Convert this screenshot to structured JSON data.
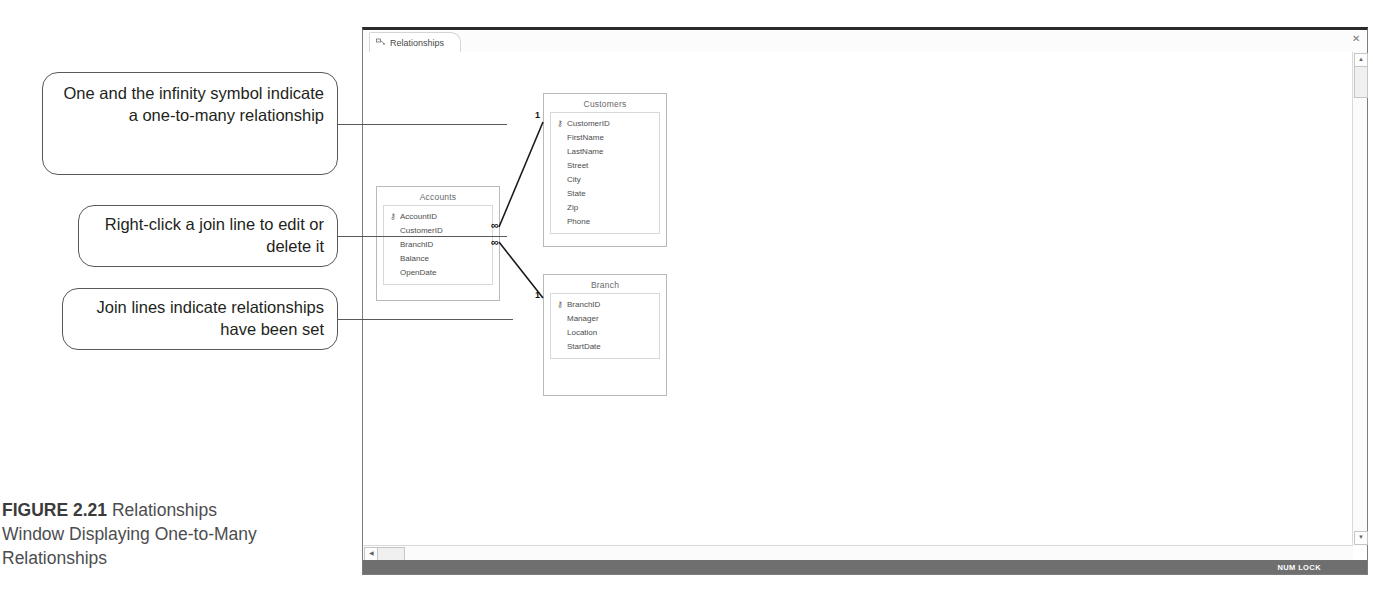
{
  "caption": {
    "figure_label": "FIGURE 2.21",
    "text": " Relationships Window Displaying One-to-Many Relationships"
  },
  "callouts": [
    {
      "id": "callout-1",
      "text": "One and the infinity symbol indicate a one-to-many relationship"
    },
    {
      "id": "callout-2",
      "text": "Right-click a join line to edit or delete it"
    },
    {
      "id": "callout-3",
      "text": "Join lines indicate relationships have been set"
    }
  ],
  "window": {
    "tab": {
      "label": "Relationships",
      "icon": "relationships-icon"
    },
    "close_label": "✕",
    "status_bar": {
      "num_lock": "NUM LOCK"
    },
    "scrollbar": {
      "up_arrow": "▲",
      "down_arrow": "▼",
      "left_arrow": "◀"
    }
  },
  "tables": [
    {
      "id": "tbl-customers",
      "name": "Customers",
      "fields": [
        {
          "name": "CustomerID",
          "key": true
        },
        {
          "name": "FirstName",
          "key": false
        },
        {
          "name": "LastName",
          "key": false
        },
        {
          "name": "Street",
          "key": false
        },
        {
          "name": "City",
          "key": false
        },
        {
          "name": "State",
          "key": false
        },
        {
          "name": "Zip",
          "key": false
        },
        {
          "name": "Phone",
          "key": false
        }
      ]
    },
    {
      "id": "tbl-accounts",
      "name": "Accounts",
      "fields": [
        {
          "name": "AccountID",
          "key": true
        },
        {
          "name": "CustomerID",
          "key": false
        },
        {
          "name": "BranchID",
          "key": false
        },
        {
          "name": "Balance",
          "key": false
        },
        {
          "name": "OpenDate",
          "key": false
        }
      ]
    },
    {
      "id": "tbl-branch",
      "name": "Branch",
      "fields": [
        {
          "name": "BranchID",
          "key": true
        },
        {
          "name": "Manager",
          "key": false
        },
        {
          "name": "Location",
          "key": false
        },
        {
          "name": "StartDate",
          "key": false
        }
      ]
    }
  ],
  "relationships": [
    {
      "id": "rel-customers-accounts",
      "one_side_table": "Customers",
      "one_side_field": "CustomerID",
      "many_side_table": "Accounts",
      "many_side_field": "CustomerID",
      "one_symbol": "1",
      "many_symbol": "∞"
    },
    {
      "id": "rel-branch-accounts",
      "one_side_table": "Branch",
      "one_side_field": "BranchID",
      "many_side_table": "Accounts",
      "many_side_field": "BranchID",
      "one_symbol": "1",
      "many_symbol": "∞"
    }
  ],
  "key_glyph": "⚷"
}
